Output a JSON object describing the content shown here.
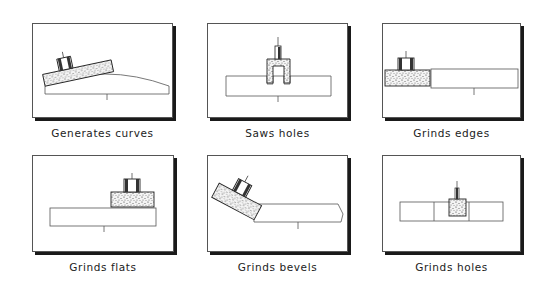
{
  "figure": {
    "panels": [
      {
        "id": "generates-curves",
        "caption": "Generates curves"
      },
      {
        "id": "saws-holes",
        "caption": "Saws holes"
      },
      {
        "id": "grinds-edges",
        "caption": "Grinds edges"
      },
      {
        "id": "grinds-flats",
        "caption": "Grinds flats"
      },
      {
        "id": "grinds-bevels",
        "caption": "Grinds bevels"
      },
      {
        "id": "grinds-holes",
        "caption": "Grinds holes"
      }
    ]
  }
}
